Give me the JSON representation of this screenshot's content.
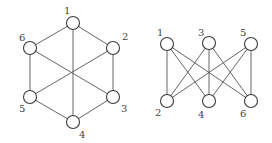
{
  "figures": [
    {
      "name": "hexagon-graph",
      "node_radius": 6.5,
      "nodes": [
        {
          "id": "1",
          "x": 73,
          "y": 23,
          "lx": 64,
          "ly": 14
        },
        {
          "id": "2",
          "x": 113,
          "y": 48,
          "lx": 122,
          "ly": 40
        },
        {
          "id": "3",
          "x": 113,
          "y": 97,
          "lx": 121,
          "ly": 112
        },
        {
          "id": "4",
          "x": 73,
          "y": 122,
          "lx": 79,
          "ly": 138
        },
        {
          "id": "5",
          "x": 30,
          "y": 97,
          "lx": 19,
          "ly": 112
        },
        {
          "id": "6",
          "x": 30,
          "y": 48,
          "lx": 19,
          "ly": 41
        }
      ],
      "edges": [
        [
          "1",
          "2"
        ],
        [
          "2",
          "3"
        ],
        [
          "3",
          "4"
        ],
        [
          "4",
          "5"
        ],
        [
          "5",
          "6"
        ],
        [
          "6",
          "1"
        ],
        [
          "1",
          "4"
        ],
        [
          "2",
          "5"
        ],
        [
          "3",
          "6"
        ]
      ]
    },
    {
      "name": "bipartite-graph",
      "node_radius": 6.5,
      "nodes": [
        {
          "id": "1",
          "x": 167,
          "y": 44,
          "lx": 157,
          "ly": 36
        },
        {
          "id": "3",
          "x": 209,
          "y": 43,
          "lx": 198,
          "ly": 36
        },
        {
          "id": "5",
          "x": 251,
          "y": 44,
          "lx": 240,
          "ly": 36
        },
        {
          "id": "2",
          "x": 167,
          "y": 101,
          "lx": 155,
          "ly": 116
        },
        {
          "id": "4",
          "x": 209,
          "y": 101,
          "lx": 198,
          "ly": 118
        },
        {
          "id": "6",
          "x": 251,
          "y": 101,
          "lx": 240,
          "ly": 117
        }
      ],
      "edges": [
        [
          "1",
          "2"
        ],
        [
          "1",
          "4"
        ],
        [
          "1",
          "6"
        ],
        [
          "3",
          "2"
        ],
        [
          "3",
          "4"
        ],
        [
          "3",
          "6"
        ],
        [
          "5",
          "2"
        ],
        [
          "5",
          "4"
        ],
        [
          "5",
          "6"
        ]
      ]
    }
  ],
  "colors": {
    "edge": "#555555",
    "node_stroke": "#3a3a3a",
    "node_fill": "#ffffff",
    "label": "#444444"
  }
}
